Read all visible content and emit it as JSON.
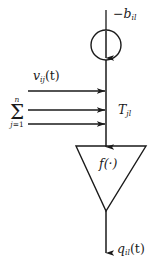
{
  "figure": {
    "kind": "neuron-block-diagram",
    "background_color": "#ffffff",
    "stroke_color": "#1a1a1a",
    "labels": {
      "bias": "−b",
      "bias_subscript": "il",
      "input": "v",
      "input_subscript": "ij",
      "input_arg": "(t)",
      "weight": "T",
      "weight_subscript": "jl",
      "activation": "f(·)",
      "output": "q",
      "output_subscript": "il",
      "output_arg": "(t)",
      "summation_sign": "Σ",
      "summation_upper": "n",
      "summation_lower_index": "j",
      "summation_lower_eq": "=",
      "summation_lower_value": "1"
    },
    "nodes": [
      {
        "name": "summing-junction-circle",
        "shape": "circle",
        "cx": 106,
        "cy": 45,
        "r": 15
      },
      {
        "name": "activation-triangle",
        "shape": "inverted-triangle",
        "top_y": 146,
        "apex_y": 211,
        "left_x": 76,
        "right_x": 146
      }
    ],
    "edges": [
      {
        "name": "bias-input-line",
        "from": [
          106,
          10
        ],
        "to": [
          106,
          57
        ],
        "arrow": "down"
      },
      {
        "name": "trunk-line",
        "from": [
          106,
          30
        ],
        "to": [
          106,
          146
        ],
        "arrow": "down"
      },
      {
        "name": "input-arrow-1",
        "from": [
          28,
          91
        ],
        "to": [
          104,
          91
        ],
        "arrow": "right"
      },
      {
        "name": "input-arrow-2",
        "from": [
          28,
          110
        ],
        "to": [
          104,
          110
        ],
        "arrow": "right"
      },
      {
        "name": "input-arrow-3",
        "from": [
          28,
          124
        ],
        "to": [
          104,
          124
        ],
        "arrow": "right"
      },
      {
        "name": "output-line",
        "from": [
          106,
          211
        ],
        "to": [
          106,
          252
        ],
        "arrow": "down"
      }
    ]
  }
}
